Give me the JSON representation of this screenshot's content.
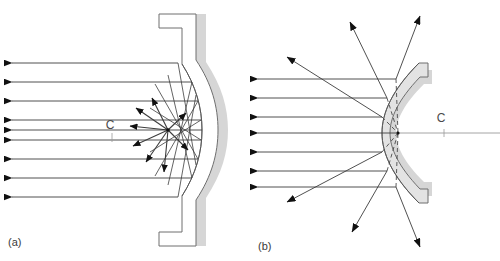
{
  "figure": {
    "type": "optics-ray-diagram",
    "width": 500,
    "height": 261,
    "background_color": "#ffffff"
  },
  "colors": {
    "ray_stroke": "#3c3c3c",
    "arrow_fill": "#111111",
    "mirror_outline": "#6e6e6e",
    "mirror_body_fill": "#ffffff",
    "mirror_band_fill": "#e3e3e3",
    "mirror_shadow_fill": "#d6d6d6",
    "axis_line": "#9a9a9a",
    "dashed_ray": "#4a4a4a",
    "label_text": "#3a3a3a"
  },
  "panels": [
    {
      "id": "a",
      "caption": "(a)",
      "caption_x": 8,
      "caption_y": 246,
      "mirror_kind": "concave",
      "center_label": {
        "text": "C",
        "x": 110,
        "y": 129,
        "tick_x": 112,
        "tick_y1": 133,
        "tick_y2": 142
      },
      "focus_point": {
        "x": 168,
        "y": 130
      },
      "incoming_rays": [
        {
          "y": 63,
          "x_start": 12,
          "x_end": 178
        },
        {
          "y": 82,
          "x_start": 12,
          "x_end": 192
        },
        {
          "y": 101,
          "x_start": 12,
          "x_end": 199
        },
        {
          "y": 120,
          "x_start": 12,
          "x_end": 202
        },
        {
          "y": 130,
          "x_start": 12,
          "x_end": 203
        },
        {
          "y": 140,
          "x_start": 12,
          "x_end": 202
        },
        {
          "y": 159,
          "x_start": 12,
          "x_end": 199
        },
        {
          "y": 178,
          "x_start": 12,
          "x_end": 192
        },
        {
          "y": 197,
          "x_start": 12,
          "x_end": 178
        }
      ],
      "radiating_arrows": [
        {
          "x": 150,
          "y": 96
        },
        {
          "x": 133,
          "y": 106
        },
        {
          "x": 128,
          "y": 124
        },
        {
          "x": 130,
          "y": 145
        },
        {
          "x": 142,
          "y": 160
        },
        {
          "x": 160,
          "y": 170
        },
        {
          "x": 183,
          "y": 115
        },
        {
          "x": 186,
          "y": 150
        }
      ]
    },
    {
      "id": "b",
      "caption": "(b)",
      "caption_x": 258,
      "caption_y": 250,
      "mirror_kind": "convex",
      "center_label": {
        "text": "C",
        "x": 441,
        "y": 122,
        "tick_x": 444,
        "tick_y1": 128,
        "tick_y2": 136
      },
      "virtual_focus": {
        "x": 398,
        "y": 133
      },
      "axis": {
        "x_start": 398,
        "x_end": 500,
        "y": 133
      },
      "incoming_rays": [
        {
          "y": 79,
          "x_start": 258,
          "x_end": 382
        },
        {
          "y": 98,
          "x_start": 258,
          "x_end": 372
        },
        {
          "y": 117,
          "x_start": 258,
          "x_end": 366
        },
        {
          "y": 133,
          "x_start": 258,
          "x_end": 364
        },
        {
          "y": 152,
          "x_start": 258,
          "x_end": 366
        },
        {
          "y": 171,
          "x_start": 258,
          "x_end": 372
        },
        {
          "y": 187,
          "x_start": 258,
          "x_end": 380
        }
      ],
      "outgoing_arrows": [
        {
          "x": 285,
          "y": 55
        },
        {
          "x": 348,
          "y": 20
        },
        {
          "x": 420,
          "y": 14
        },
        {
          "x": 283,
          "y": 200
        },
        {
          "x": 350,
          "y": 230
        },
        {
          "x": 418,
          "y": 245
        }
      ]
    }
  ]
}
